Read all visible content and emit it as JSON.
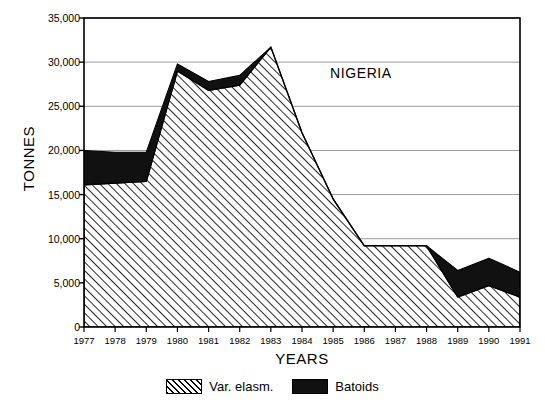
{
  "chart_data": {
    "type": "area",
    "title": "",
    "annotation": "NIGERIA",
    "xlabel": "YEARS",
    "ylabel": "TONNES",
    "stacked": true,
    "grid": true,
    "legend_position": "bottom",
    "ylim": [
      0,
      35000
    ],
    "yticks": [
      0,
      5000,
      10000,
      15000,
      20000,
      25000,
      30000,
      35000
    ],
    "ytick_labels": [
      "0",
      "5,000",
      "10,000",
      "15,000",
      "20,000",
      "25,000",
      "30,000",
      "35,000"
    ],
    "categories": [
      1977,
      1978,
      1979,
      1980,
      1981,
      1982,
      1983,
      1984,
      1985,
      1986,
      1987,
      1988,
      1989,
      1990,
      1991
    ],
    "xtick_labels": [
      "1977",
      "1978",
      "1979",
      "1980",
      "1981",
      "1982",
      "1983",
      "1984",
      "1985",
      "1986",
      "1987",
      "1988",
      "1989",
      "1990",
      "1991"
    ],
    "series": [
      {
        "name": "Var. elasm.",
        "pattern": "hatch",
        "color": "#ffffff",
        "values": [
          16100,
          16300,
          16500,
          29000,
          26800,
          27400,
          31700,
          22000,
          14500,
          9200,
          9200,
          9200,
          3400,
          4700,
          3400
        ]
      },
      {
        "name": "Batoids",
        "pattern": "solid",
        "color": "#111111",
        "values": [
          3900,
          3500,
          3300,
          800,
          1000,
          1100,
          0,
          0,
          0,
          0,
          0,
          0,
          3000,
          3100,
          2800
        ]
      }
    ],
    "totals": [
      20000,
      19800,
      19800,
      29800,
      27800,
      28500,
      31700,
      22000,
      14500,
      9200,
      9200,
      9200,
      6400,
      7800,
      6200
    ]
  },
  "legend": {
    "items": [
      {
        "label": "Var. elasm.",
        "swatch": "hatch-swatch"
      },
      {
        "label": "Batoids",
        "swatch": "solid-swatch"
      }
    ]
  },
  "colors": {
    "axis": "#000000",
    "grid": "#9a9a9a",
    "batoids": "#111111",
    "var_elasm_fill": "#ffffff",
    "background": "#ffffff"
  }
}
